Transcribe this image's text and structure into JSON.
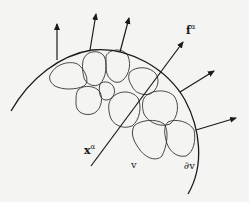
{
  "diagram": {
    "colors": {
      "stroke": "#1a1a1a",
      "background": "#f4f4f2"
    },
    "labels": {
      "force": {
        "base": "f",
        "sup": "α"
      },
      "position": {
        "base": "x",
        "sup": "α"
      },
      "volume": "v",
      "boundary": "∂v"
    },
    "boundary_arc": "M11,111 C30,78 60,55 92,50 C130,46 168,70 185,100 C200,128 205,165 188,194",
    "particles": [
      "M52,72 C58,62 75,60 80,66 C86,72 90,82 84,86 C76,90 62,90 55,86 C49,82 48,76 52,72 Z",
      "M84,58 C88,50 100,50 104,56 C108,64 106,78 100,84 C94,88 86,84 84,78 C82,70 82,62 84,58 Z",
      "M106,56 C110,48 124,48 128,56 C132,66 128,78 120,82 C112,84 106,76 106,68 Z",
      "M130,72 C136,66 150,66 156,74 C160,80 158,90 150,94 C142,96 134,92 132,86 C128,80 128,76 130,72 Z",
      "M78,90 C84,84 96,86 100,92 C104,100 100,112 92,114 C84,116 76,112 76,104 C76,96 76,94 78,90 Z",
      "M112,98 C118,90 132,90 138,98 C142,106 140,120 132,126 C122,130 112,124 110,116 C108,108 108,102 112,98 Z",
      "M144,98 C150,90 166,88 174,96 C180,104 178,118 170,124 C160,128 148,122 144,114 C142,108 142,102 144,98 Z",
      "M100,84 C104,80 112,82 114,88 C116,94 112,100 106,100 C100,100 98,92 100,84 Z",
      "M134,126 C140,120 156,118 164,124 C170,132 166,148 162,156 C156,162 146,158 140,150 C134,142 130,134 134,126 Z",
      "M168,122 C176,118 190,122 194,130 C196,140 194,152 186,156 C176,158 168,150 166,140 C164,132 164,126 168,122 Z"
    ],
    "arrows": [
      {
        "name": "boundary-force-1",
        "from": [
          57,
          60
        ],
        "to": [
          57,
          24
        ]
      },
      {
        "name": "boundary-force-2",
        "from": [
          90,
          50
        ],
        "to": [
          96,
          14
        ]
      },
      {
        "name": "boundary-force-3",
        "from": [
          120,
          52
        ],
        "to": [
          129,
          18
        ]
      },
      {
        "name": "boundary-force-4",
        "from": [
          180,
          92
        ],
        "to": [
          214,
          71
        ]
      },
      {
        "name": "boundary-force-5",
        "from": [
          196,
          130
        ],
        "to": [
          236,
          118
        ]
      },
      {
        "name": "force-f-alpha-line",
        "from": [
          91,
          166
        ],
        "to": [
          183,
          42
        ]
      }
    ]
  }
}
